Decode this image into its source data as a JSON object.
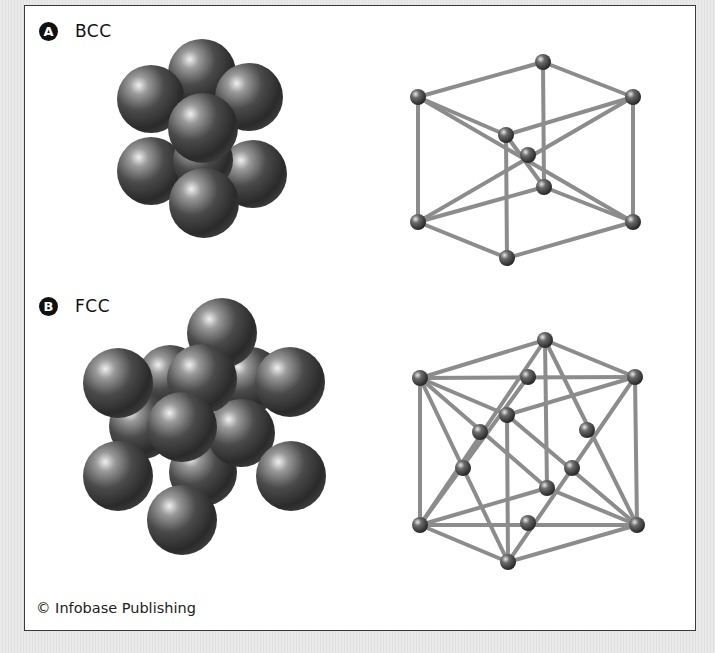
{
  "panels": [
    {
      "badge": "A",
      "label": "BCC"
    },
    {
      "badge": "B",
      "label": "FCC"
    }
  ],
  "credit": "© Infobase Publishing",
  "colors": {
    "frame_border": "#3a3a3a",
    "sphere_dark": "#2e2e2e",
    "sphere_light": "#e8e8e8",
    "rod": "#8c8c8c",
    "background": "#e6e6e6"
  },
  "icons": {
    "copyright": "copyright-symbol"
  }
}
